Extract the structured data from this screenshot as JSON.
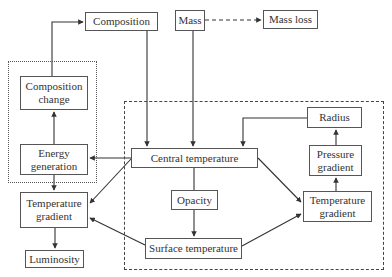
{
  "diagram": {
    "groups": {
      "dotted": "energy-composition-group",
      "dashed": "structure-group"
    },
    "nodes": {
      "composition": "Composition",
      "mass": "Mass",
      "mass_loss": "Mass loss",
      "composition_change": "Composition change",
      "energy_generation": "Energy generation",
      "temperature_gradient_left": "Temperature gradient",
      "luminosity": "Luminosity",
      "central_temperature": "Central temperature",
      "opacity": "Opacity",
      "surface_temperature": "Surface temperature",
      "radius": "Radius",
      "pressure_gradient": "Pressure gradient",
      "temperature_gradient_right": "Temperature gradient"
    },
    "edges": [
      {
        "from": "Composition change",
        "to": "Composition",
        "style": "solid"
      },
      {
        "from": "Mass",
        "to": "Mass loss",
        "style": "dashed"
      },
      {
        "from": "Composition",
        "to": "Central temperature",
        "style": "solid"
      },
      {
        "from": "Mass",
        "to": "Central temperature",
        "style": "solid"
      },
      {
        "from": "Radius",
        "to": "Central temperature",
        "style": "solid"
      },
      {
        "from": "Energy generation",
        "to": "Composition change",
        "style": "solid"
      },
      {
        "from": "Central temperature",
        "to": "Energy generation",
        "style": "solid"
      },
      {
        "from": "Central temperature",
        "to": "Temperature gradient (left)",
        "style": "solid"
      },
      {
        "from": "Energy generation",
        "to": "Temperature gradient (left)",
        "style": "solid"
      },
      {
        "from": "Temperature gradient (left)",
        "to": "Luminosity",
        "style": "solid"
      },
      {
        "from": "Central temperature",
        "to": "Opacity",
        "style": "solid"
      },
      {
        "from": "Opacity",
        "to": "Surface temperature",
        "style": "solid"
      },
      {
        "from": "Surface temperature",
        "to": "Temperature gradient (left)",
        "style": "solid"
      },
      {
        "from": "Central temperature",
        "to": "Temperature gradient (right)",
        "style": "solid"
      },
      {
        "from": "Surface temperature",
        "to": "Temperature gradient (right)",
        "style": "solid"
      },
      {
        "from": "Temperature gradient (right)",
        "to": "Pressure gradient",
        "style": "solid"
      },
      {
        "from": "Pressure gradient",
        "to": "Radius",
        "style": "solid"
      }
    ]
  }
}
